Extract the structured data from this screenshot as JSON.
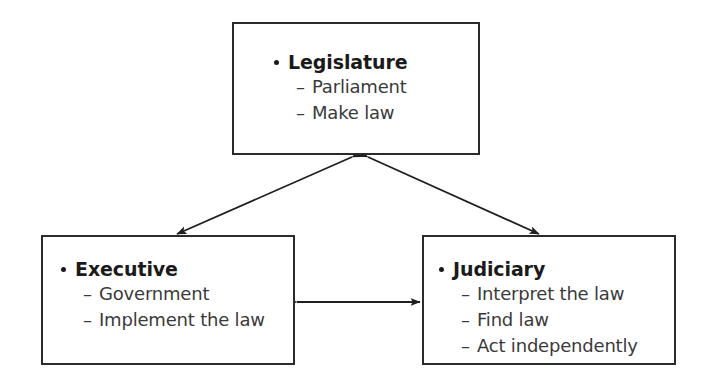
{
  "diagram": {
    "background_color": "#ffffff",
    "line_color": "#2b2b2b",
    "text_color": "#1a1a1a",
    "sub_text_color": "#3a3a3a",
    "nodes": [
      {
        "id": "legislature",
        "title": "Legislature",
        "items": [
          {
            "dash": "–",
            "text": "Parliament"
          },
          {
            "dash": "–",
            "text": "Make law"
          }
        ]
      },
      {
        "id": "executive",
        "title": "Executive",
        "items": [
          {
            "dash": "–",
            "text": "Government"
          },
          {
            "dash": "–",
            "text": "Implement the law"
          }
        ]
      },
      {
        "id": "judiciary",
        "title": "Judiciary",
        "items": [
          {
            "dash": "–",
            "text": "Interpret the law"
          },
          {
            "dash": "–",
            "text": "Find law"
          },
          {
            "dash": "–",
            "text": "Act independently"
          }
        ]
      }
    ],
    "connectors": [
      {
        "id": "legislature-executive",
        "from": "legislature",
        "to": "executive",
        "style": "double-headed",
        "orientation": "diagonal-left"
      },
      {
        "id": "legislature-judiciary",
        "from": "legislature",
        "to": "judiciary",
        "style": "double-headed",
        "orientation": "diagonal-right"
      },
      {
        "id": "executive-judiciary",
        "from": "executive",
        "to": "judiciary",
        "style": "double-headed",
        "orientation": "horizontal"
      }
    ]
  }
}
